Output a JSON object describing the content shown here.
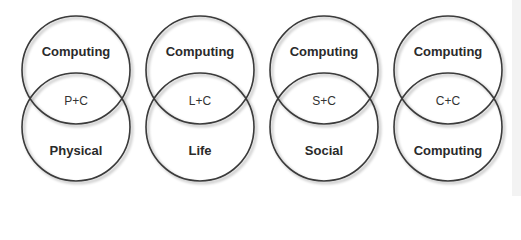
{
  "diagrams": [
    {
      "top": "Computing",
      "intersection": "P+C",
      "bottom": "Physical"
    },
    {
      "top": "Computing",
      "intersection": "L+C",
      "bottom": "Life"
    },
    {
      "top": "Computing",
      "intersection": "S+C",
      "bottom": "Social"
    },
    {
      "top": "Computing",
      "intersection": "C+C",
      "bottom": "Computing"
    }
  ],
  "colors": {
    "stroke": "#3a3a3a",
    "text": "#2a2a2a"
  }
}
